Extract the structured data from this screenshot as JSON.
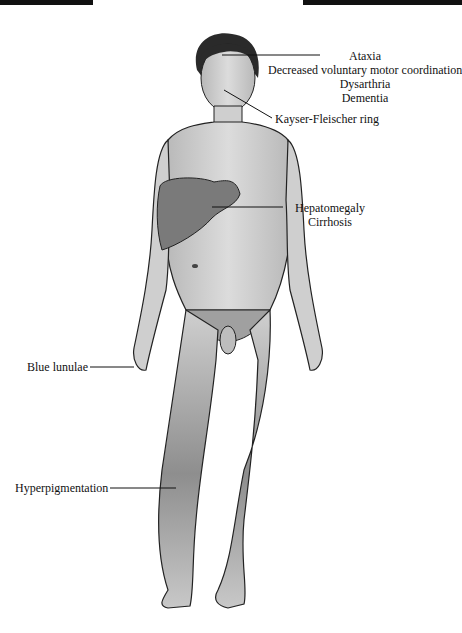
{
  "figure": {
    "colors": {
      "skin": "#d2d2d2",
      "skin_dark": "#9a9a9a",
      "liver": "#7a7a7a",
      "hair": "#2a2a2a",
      "outline": "#222222"
    }
  },
  "labels": {
    "head": {
      "lines": [
        "Ataxia",
        "Decreased voluntary motor coordination",
        "Dysarthria",
        "Dementia"
      ]
    },
    "eye": "Kayser-Fleischer ring",
    "liver": [
      "Hepatomegaly",
      "Cirrhosis"
    ],
    "hand": "Blue lunulae",
    "leg": "Hyperpigmentation"
  }
}
